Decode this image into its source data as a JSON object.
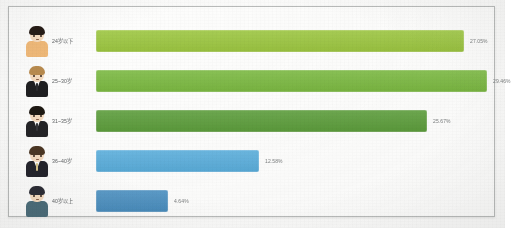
{
  "chart_data": {
    "type": "bar",
    "orientation": "horizontal",
    "title": "",
    "xlabel": "",
    "ylabel": "",
    "grid": false,
    "legend": null,
    "value_suffix": "%",
    "categories": [
      "24岁以下",
      "25~30岁",
      "31~35岁",
      "36~40岁",
      "40岁以上"
    ],
    "values": [
      27.05,
      29.46,
      25.67,
      12.58,
      4.64
    ],
    "value_labels": [
      "27.05%",
      "29.46%",
      "25.67%",
      "12.58%",
      "4.64%"
    ],
    "colors": [
      "#9dc741",
      "#7cba42",
      "#5d9e3c",
      "#5bafdd",
      "#4a90c2"
    ],
    "bar_pixel_widths": [
      368,
      391,
      331,
      163,
      72
    ],
    "series": [
      {
        "name": "年龄分布",
        "values": [
          27.05,
          29.46,
          25.67,
          12.58,
          4.64
        ]
      }
    ]
  },
  "rows": [
    {
      "label": "24岁以下",
      "value_label": "27.05%",
      "avatar": {
        "name": "avatar-young-person",
        "hair": "#241a14",
        "body": "#f0b978",
        "collar": false,
        "tie": null
      }
    },
    {
      "label": "25~30岁",
      "value_label": "29.46%",
      "avatar": {
        "name": "avatar-man-light-hair-suit",
        "hair": "#b98b4e",
        "body": "#1e1e20",
        "collar": true,
        "tie": "#2b2b2e"
      }
    },
    {
      "label": "31~35岁",
      "value_label": "25.67%",
      "avatar": {
        "name": "avatar-man-dark-hair-suit",
        "hair": "#1d1812",
        "body": "#232326",
        "collar": true,
        "tie": "#36363a"
      }
    },
    {
      "label": "36~40岁",
      "value_label": "12.58%",
      "avatar": {
        "name": "avatar-man-brown-hair-suit",
        "hair": "#4a3522",
        "body": "#22222a",
        "collar": true,
        "tie": "#d8c48a"
      }
    },
    {
      "label": "40岁以上",
      "value_label": "4.64%",
      "avatar": {
        "name": "avatar-man-blue-shirt",
        "hair": "#2a2b33",
        "body": "#4a6b78",
        "collar": false,
        "tie": null
      }
    }
  ]
}
